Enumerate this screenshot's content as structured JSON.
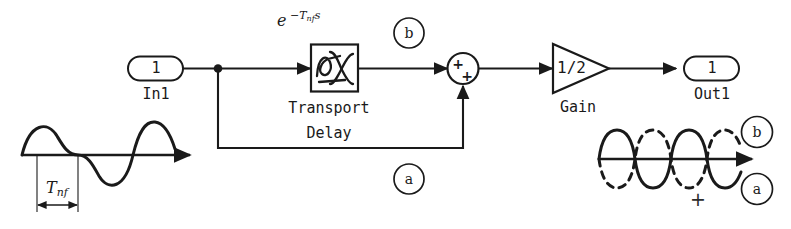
{
  "diagram": {
    "ink_color": "#1a1a1a",
    "background_color": "#ffffff"
  },
  "blocks": {
    "in_port": {
      "name": "In1",
      "port_number": "1",
      "shape": "rounded-rect-port"
    },
    "transport_delay": {
      "label_line1": "Transport",
      "label_line2": "Delay",
      "equation": "e",
      "equation_exponent_minus": "−",
      "equation_exponent_T": "T",
      "equation_exponent_sub": "nf",
      "equation_exponent_s": "s",
      "icon": "sine-delay-icon"
    },
    "sum": {
      "sign_left": "+",
      "sign_bottom": "+",
      "shape": "circle"
    },
    "gain": {
      "value": "1/2",
      "name": "Gain",
      "shape": "triangle"
    },
    "out_port": {
      "name": "Out1",
      "port_number": "1",
      "shape": "rounded-rect-port"
    }
  },
  "signal_tags": {
    "tag_b_diagram": "b",
    "tag_a_diagram": "a",
    "tag_b_waveform": "b",
    "tag_a_waveform": "a"
  },
  "input_waveform": {
    "period_label_T": "T",
    "period_label_sub": "nf",
    "description": "sine wave with half-period T_nf dimensioned"
  },
  "output_waveform": {
    "plus_sign": "+",
    "solid_trace_tag": "a",
    "dashed_trace_tag": "b",
    "description": "solid wave a and dashed wave b, 180 degrees out of phase, summed"
  }
}
